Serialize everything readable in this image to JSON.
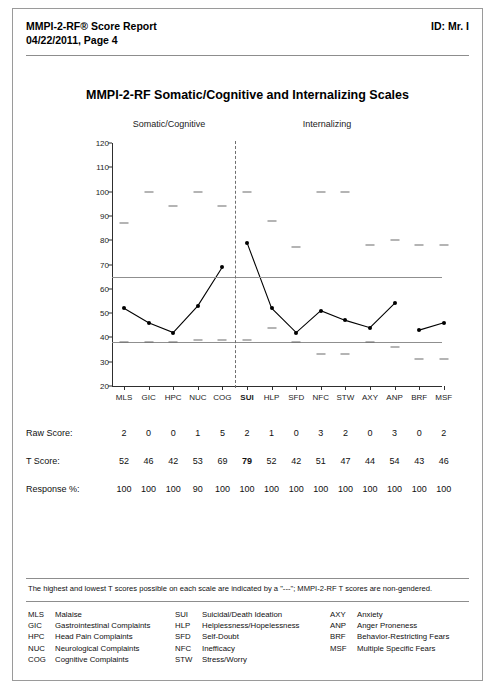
{
  "header": {
    "title_lines": "MMPI-2-RF® Score Report\n04/22/2011, Page 4",
    "id_label": "ID: Mr. I"
  },
  "chart": {
    "title": "MMPI-2-RF Somatic/Cognitive and Internalizing Scales",
    "group_left": "Somatic/Cognitive",
    "group_right": "Internalizing"
  },
  "rows": {
    "raw_label": "Raw Score:",
    "t_label": "T Score:",
    "response_label": "Response %:"
  },
  "footnote": "The highest and lowest T scores possible on each scale are indicated by a \"---\"; MMPI-2-RF T scores are non-gendered.",
  "key_columns": [
    [
      {
        "abbr": "MLS",
        "name": "Malaise"
      },
      {
        "abbr": "GIC",
        "name": "Gastrointestinal Complaints"
      },
      {
        "abbr": "HPC",
        "name": "Head Pain Complaints"
      },
      {
        "abbr": "NUC",
        "name": "Neurological Complaints"
      },
      {
        "abbr": "COG",
        "name": "Cognitive Complaints"
      }
    ],
    [
      {
        "abbr": "SUI",
        "name": "Suicidal/Death Ideation"
      },
      {
        "abbr": "HLP",
        "name": "Helplessness/Hopelessness"
      },
      {
        "abbr": "SFD",
        "name": "Self-Doubt"
      },
      {
        "abbr": "NFC",
        "name": "Inefficacy"
      },
      {
        "abbr": "STW",
        "name": "Stress/Worry"
      }
    ],
    [
      {
        "abbr": "AXY",
        "name": "Anxiety"
      },
      {
        "abbr": "ANP",
        "name": "Anger Proneness"
      },
      {
        "abbr": "BRF",
        "name": "Behavior-Restricting Fears"
      },
      {
        "abbr": "MSF",
        "name": "Multiple Specific Fears"
      }
    ]
  ],
  "chart_data": {
    "type": "line",
    "title": "MMPI-2-RF Somatic/Cognitive and Internalizing Scales",
    "xlabel": "",
    "ylabel": "T Score",
    "ylim": [
      20,
      120
    ],
    "ytick_step": 10,
    "yticks": [
      20,
      30,
      40,
      50,
      60,
      70,
      80,
      90,
      100,
      110,
      120
    ],
    "grid": false,
    "reference_lines": [
      65,
      38
    ],
    "group_divider_after_index": 4,
    "categories": [
      "MLS",
      "GIC",
      "HPC",
      "NUC",
      "COG",
      "SUI",
      "HLP",
      "SFD",
      "NFC",
      "STW",
      "AXY",
      "ANP",
      "BRF",
      "MSF"
    ],
    "highlighted_category": "SUI",
    "series": [
      {
        "name": "T Score",
        "values": [
          52,
          46,
          42,
          53,
          69,
          79,
          52,
          42,
          51,
          47,
          44,
          54,
          43,
          46
        ],
        "segments": [
          [
            0,
            4
          ],
          [
            5,
            11
          ],
          [
            12,
            13
          ]
        ]
      },
      {
        "name": "Highest T score possible",
        "marker": "dashes",
        "values": [
          87,
          100,
          94,
          100,
          94,
          100,
          88,
          77,
          100,
          100,
          78,
          80,
          78,
          78
        ]
      },
      {
        "name": "Lowest T score possible",
        "marker": "dashes",
        "values": [
          38,
          38,
          38,
          39,
          39,
          39,
          44,
          38,
          33,
          33,
          38,
          36,
          31,
          31
        ]
      }
    ],
    "raw_scores": [
      2,
      0,
      0,
      1,
      5,
      2,
      1,
      0,
      3,
      2,
      0,
      3,
      0,
      2
    ],
    "t_scores": [
      52,
      46,
      42,
      53,
      69,
      79,
      52,
      42,
      51,
      47,
      44,
      54,
      43,
      46
    ],
    "response_pct": [
      100,
      100,
      100,
      90,
      100,
      100,
      100,
      100,
      100,
      100,
      100,
      100,
      100,
      100
    ]
  }
}
